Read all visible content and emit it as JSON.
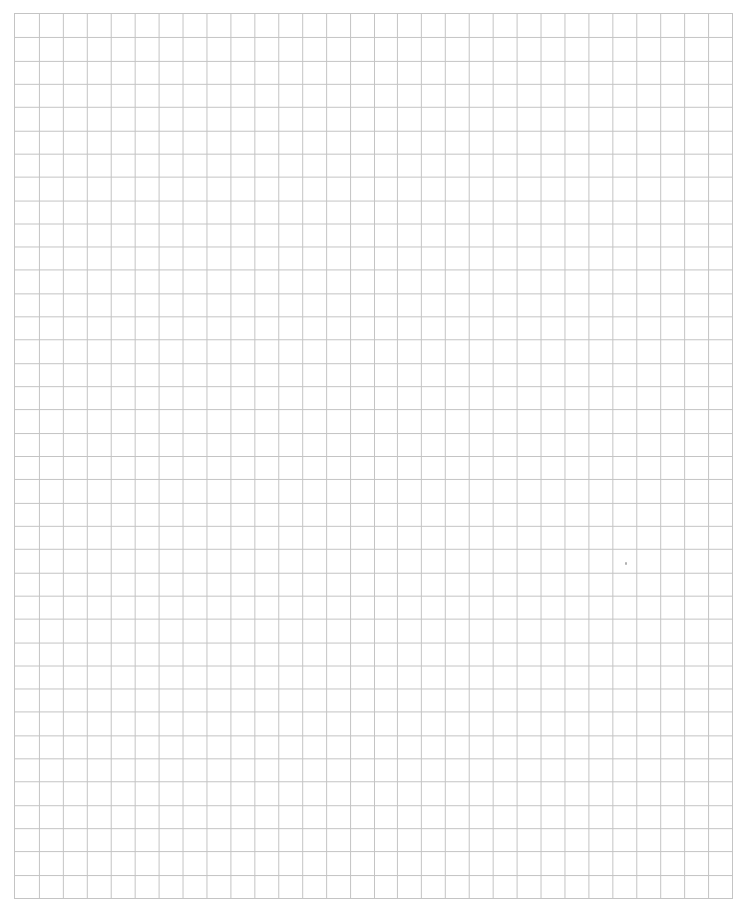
{
  "page": {
    "type": "graph-paper",
    "background_color": "#ffffff",
    "line_color": "#c4c4c4"
  },
  "grid": {
    "columns": 30,
    "rows": 38,
    "origin_px": [
      14,
      13
    ],
    "size_px": [
      719,
      886
    ]
  },
  "marks": [
    {
      "name": "stray-mark",
      "x": 625,
      "y": 562
    }
  ]
}
